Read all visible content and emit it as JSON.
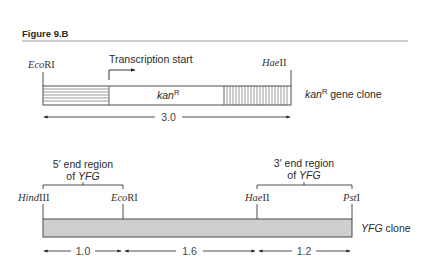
{
  "figure": {
    "title": "Figure 9.B"
  },
  "top_construct": {
    "name": "kanR gene clone",
    "label_main": "kan",
    "label_sup": "R",
    "caption_main": "kan",
    "caption_sup": "R",
    "caption_rest": " gene clone",
    "transcription_label": "Transcription start",
    "sites": [
      {
        "name_italic": "Eco",
        "name_roman": "RI"
      },
      {
        "name_italic": "Hae",
        "name_roman": "II"
      }
    ],
    "length": "3.0",
    "segments": [
      {
        "name": "horizontal-hatched-region"
      },
      {
        "name": "kanR-coding-region"
      },
      {
        "name": "vertical-hatched-region"
      }
    ]
  },
  "bottom_construct": {
    "caption_italic": "YFG",
    "caption_rest": " clone",
    "five_prime": {
      "line1": "5′ end region",
      "line2_pre": "of ",
      "line2_italic": "YFG"
    },
    "three_prime": {
      "line1": "3′ end region",
      "line2_pre": "of ",
      "line2_italic": "YFG"
    },
    "sites": [
      {
        "name_italic": "Hind",
        "name_roman": "III"
      },
      {
        "name_italic": "Eco",
        "name_roman": "RI"
      },
      {
        "name_italic": "Hae",
        "name_roman": "II"
      },
      {
        "name_italic": "Pst",
        "name_roman": "I"
      }
    ],
    "distances": [
      "1.0",
      "1.6",
      "1.2"
    ]
  },
  "colors": {
    "line": "#3a3a3a",
    "bar_fill": "#cfcfcf",
    "rule": "#9a9a9a"
  }
}
